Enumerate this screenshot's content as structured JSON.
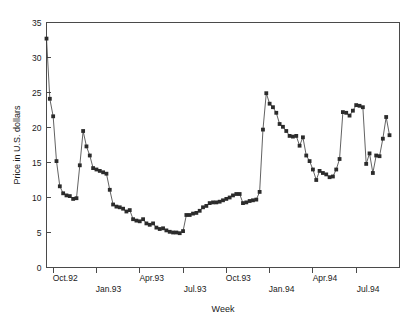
{
  "chart_data": {
    "type": "line",
    "title": "",
    "xlabel": "Week",
    "ylabel": "Price in U.S. dollars",
    "ylim": [
      0,
      35
    ],
    "yticks": [
      0,
      5,
      10,
      15,
      20,
      25,
      30,
      35
    ],
    "ytick_labels": [
      "0",
      "5",
      "10",
      "15",
      "20",
      "25",
      "30",
      "35"
    ],
    "xtick_labels": [
      "Oct.92",
      "Jan.93",
      "Apr.93",
      "Jul.93",
      "Oct.93",
      "Jan.94",
      "Apr.94",
      "Jul.94"
    ],
    "xtick_index": [
      2,
      15,
      28,
      41,
      54,
      67,
      80,
      93
    ],
    "grid": false,
    "legend": null,
    "marker": "square",
    "marker_color": "#2b2b2b",
    "line_color": "#3a3a3a",
    "n_points": 97,
    "x": [
      0,
      1,
      2,
      3,
      4,
      5,
      6,
      7,
      8,
      9,
      10,
      11,
      12,
      13,
      14,
      15,
      16,
      17,
      18,
      19,
      20,
      21,
      22,
      23,
      24,
      25,
      26,
      27,
      28,
      29,
      30,
      31,
      32,
      33,
      34,
      35,
      36,
      37,
      38,
      39,
      40,
      41,
      42,
      43,
      44,
      45,
      46,
      47,
      48,
      49,
      50,
      51,
      52,
      53,
      54,
      55,
      56,
      57,
      58,
      59,
      60,
      61,
      62,
      63,
      64,
      65,
      66,
      67,
      68,
      69,
      70,
      71,
      72,
      73,
      74,
      75,
      76,
      77,
      78,
      79,
      80,
      81,
      82,
      83,
      84,
      85,
      86,
      87,
      88,
      89,
      90,
      91,
      92,
      93,
      94,
      95,
      96
    ],
    "values": [
      32.7,
      24.1,
      21.6,
      15.2,
      11.6,
      10.6,
      10.3,
      10.2,
      9.8,
      9.9,
      14.6,
      19.5,
      17.3,
      16.0,
      14.2,
      14.0,
      13.8,
      13.6,
      13.4,
      11.1,
      9.0,
      8.7,
      8.6,
      8.4,
      8.0,
      8.2,
      6.9,
      6.7,
      6.6,
      6.9,
      6.3,
      6.1,
      6.3,
      5.7,
      5.5,
      5.6,
      5.3,
      5.1,
      5.0,
      5.0,
      4.9,
      5.2,
      7.5,
      7.5,
      7.7,
      7.8,
      8.1,
      8.6,
      8.8,
      9.2,
      9.3,
      9.3,
      9.4,
      9.6,
      9.8,
      10.0,
      10.3,
      10.5,
      10.5,
      9.2,
      9.3,
      9.5,
      9.6,
      9.7,
      10.8,
      19.7,
      24.9,
      23.4,
      22.9,
      22.1,
      20.5,
      20.1,
      19.5,
      18.8,
      18.7,
      18.8,
      17.4,
      18.6,
      16.0,
      15.2,
      14.0,
      12.5,
      13.8,
      13.5,
      13.3,
      12.9,
      13.0,
      14.0,
      15.5,
      22.2,
      22.1,
      21.7,
      22.4,
      23.2,
      23.1,
      22.9,
      14.8
    ]
  },
  "extra_tail": {
    "x": [
      97,
      98,
      99,
      100,
      101,
      102,
      103
    ],
    "values": [
      16.3,
      13.5,
      16.0,
      15.9,
      18.4,
      21.5,
      18.9
    ]
  },
  "axis": {
    "x_axis_name": "Week",
    "y_axis_name": "Price in U.S. dollars"
  }
}
